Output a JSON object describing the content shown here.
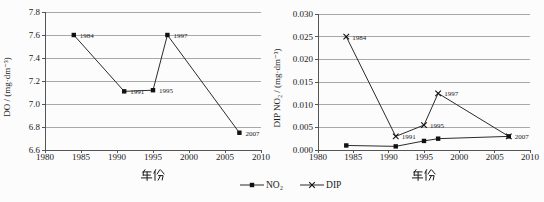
{
  "figure": {
    "xlabel_text": "年份"
  },
  "chart_data": [
    {
      "type": "line",
      "title": "",
      "xlabel": "年份",
      "ylabel": "DO / (mg·dm⁻³)",
      "xlim": [
        1980,
        2010
      ],
      "ylim": [
        6.6,
        7.8
      ],
      "grid": true,
      "legend_position": "none",
      "xticks": {
        "values": [
          1980,
          1985,
          1990,
          1995,
          2000,
          2005,
          2010
        ],
        "labels": [
          "1980",
          "1985",
          "1990",
          "1995",
          "2000",
          "2005",
          "2010"
        ]
      },
      "yticks": {
        "values": [
          6.6,
          6.8,
          7.0,
          7.2,
          7.4,
          7.6,
          7.8
        ],
        "labels": [
          "6.6",
          "6.8",
          "7.0",
          "7.2",
          "7.4",
          "7.6",
          "7.8"
        ]
      },
      "x": [
        1984,
        1991,
        1995,
        1997,
        2007
      ],
      "series": [
        {
          "name": "DO",
          "marker": "square",
          "color": "#2b2b2b",
          "values": [
            7.6,
            7.11,
            7.12,
            7.6,
            6.75
          ],
          "point_labels": [
            "1984",
            "1991",
            "1995",
            "1997",
            "2007"
          ]
        }
      ]
    },
    {
      "type": "line",
      "title": "",
      "xlabel": "年份",
      "ylabel": "DIP NO₂ / (mg·dm⁻³)",
      "xlim": [
        1980,
        2010
      ],
      "ylim": [
        0.0,
        0.03
      ],
      "grid": true,
      "legend_position": "bottom",
      "xticks": {
        "values": [
          1980,
          1985,
          1990,
          1995,
          2000,
          2005,
          2010
        ],
        "labels": [
          "1980",
          "1985",
          "1990",
          "1995",
          "2000",
          "2005",
          "2010"
        ]
      },
      "yticks": {
        "values": [
          0.0,
          0.005,
          0.01,
          0.015,
          0.02,
          0.025,
          0.03
        ],
        "labels": [
          "0.000",
          "0.005",
          "0.010",
          "0.015",
          "0.020",
          "0.025",
          "0.030"
        ]
      },
      "x": [
        1984,
        1991,
        1995,
        1997,
        2007
      ],
      "series": [
        {
          "name": "NO₂",
          "marker": "square",
          "color": "#2b2b2b",
          "values": [
            0.001,
            0.0008,
            0.002,
            0.0025,
            0.003
          ],
          "point_labels": []
        },
        {
          "name": "DIP",
          "marker": "x",
          "color": "#2b2b2b",
          "values": [
            0.025,
            0.003,
            0.0055,
            0.0125,
            0.003
          ],
          "point_labels": [
            "1984",
            "1991",
            "1995",
            "1997",
            "2007"
          ]
        }
      ]
    }
  ],
  "legend": {
    "items": [
      {
        "label": "NO₂",
        "marker": "square"
      },
      {
        "label": "DIP",
        "marker": "x"
      }
    ]
  },
  "colors": {
    "line": "#2b2b2b",
    "marker": "#111111",
    "grid": "#a8a8a8",
    "axis": "#555555",
    "text": "#1a1a1a",
    "background": "#fcfcfc"
  }
}
